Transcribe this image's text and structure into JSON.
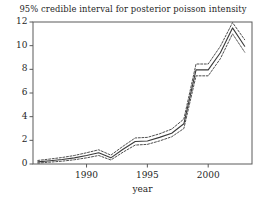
{
  "chart_data": {
    "type": "line",
    "title": "95% credible interval for posterior poisson intensity",
    "xlabel": "year",
    "ylabel": "",
    "xlim": [
      1985.6,
      2003.6
    ],
    "ylim": [
      0,
      12
    ],
    "grid": false,
    "legend": "none",
    "xticks": [
      1990,
      1995,
      2000
    ],
    "xticklabels": [
      "1990",
      "1995",
      "2000"
    ],
    "yticks": [
      0,
      2,
      4,
      6,
      8,
      10,
      12
    ],
    "yticklabels": [
      "0",
      "2",
      "4",
      "6",
      "8",
      "10",
      "12"
    ],
    "x": [
      1986,
      1987,
      1988,
      1989,
      1990,
      1991,
      1992,
      1993,
      1994,
      1995,
      1996,
      1997,
      1998,
      1999,
      2000,
      2001,
      2002,
      2003
    ],
    "series": [
      {
        "name": "posterior mean intensity",
        "style": "solid",
        "color": "#3a3a3a",
        "values": [
          0.18,
          0.28,
          0.38,
          0.52,
          0.72,
          0.95,
          0.52,
          1.25,
          1.9,
          1.95,
          2.25,
          2.6,
          3.4,
          7.95,
          7.95,
          9.4,
          11.5,
          9.95
        ]
      },
      {
        "name": "upper 97.5% credible bound",
        "style": "dashed",
        "color": "#3a3a3a",
        "values": [
          0.3,
          0.42,
          0.55,
          0.72,
          0.95,
          1.2,
          0.75,
          1.5,
          2.2,
          2.25,
          2.55,
          2.95,
          3.8,
          8.45,
          8.45,
          9.95,
          11.95,
          10.5
        ]
      },
      {
        "name": "lower 2.5% credible bound",
        "style": "dashed",
        "color": "#3a3a3a",
        "values": [
          0.08,
          0.16,
          0.24,
          0.36,
          0.52,
          0.72,
          0.34,
          1.0,
          1.6,
          1.66,
          1.95,
          2.3,
          3.0,
          7.45,
          7.45,
          8.9,
          11.0,
          9.45
        ]
      }
    ]
  },
  "axes": {
    "frame_color": "#5a5a5a",
    "tick_color": "#5a5a5a"
  }
}
